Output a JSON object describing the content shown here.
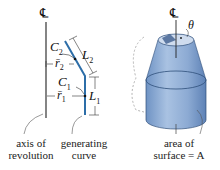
{
  "left_diagram": {
    "centerline_symbol": "℄",
    "labels": {
      "c2": "C",
      "c2_sub": "2",
      "l2": "L",
      "l2_sub": "2",
      "r2": "r̄",
      "r2_sub": "2",
      "c1": "C",
      "c1_sub": "1",
      "r1": "r̄",
      "r1_sub": "1",
      "l1": "L",
      "l1_sub": "1"
    },
    "captions": {
      "axis": [
        "axis of",
        "revolution"
      ],
      "curve": [
        "generating",
        "curve"
      ]
    },
    "curve_color": "#2d6ea8"
  },
  "right_diagram": {
    "centerline_symbol": "℄",
    "angle_label": "θ",
    "caption": [
      "area of",
      "surface = A"
    ],
    "surface_color": "#7fa3cf"
  }
}
